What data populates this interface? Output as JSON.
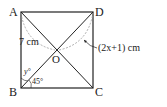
{
  "figure": {
    "type": "rectangle-with-diagonals",
    "vertices": {
      "A": {
        "label": "A"
      },
      "B": {
        "label": "B"
      },
      "C": {
        "label": "C"
      },
      "D": {
        "label": "D"
      },
      "O": {
        "label": "O"
      }
    },
    "measures": {
      "AO": "7 cm",
      "DO": "(2x+1) cm",
      "angle_ABO": "y°",
      "angle_OBC": "45°"
    },
    "colors": {
      "stroke": "#222222",
      "dashed": "#999999"
    }
  }
}
